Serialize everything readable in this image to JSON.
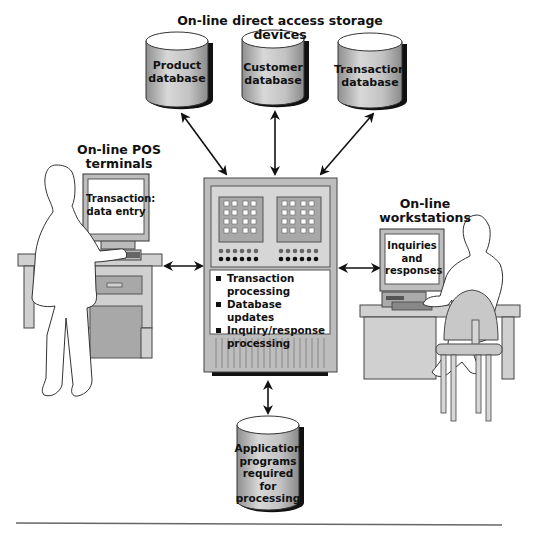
{
  "diagram": {
    "title": "On-line direct access storage devices",
    "databases": [
      {
        "label_line1": "Product",
        "label_line2": "database"
      },
      {
        "label_line1": "Customer",
        "label_line2": "database"
      },
      {
        "label_line1": "Transaction",
        "label_line2": "database"
      }
    ],
    "pos_terminals": {
      "title_line1": "On-line POS",
      "title_line2": "terminals",
      "screen_line1": "Transaction:",
      "screen_line2": "data entry"
    },
    "workstations": {
      "title_line1": "On-line",
      "title_line2": "workstations",
      "screen_line1": "Inquiries",
      "screen_line2": "and",
      "screen_line3": "responses"
    },
    "mainframe": {
      "functions": [
        "Transaction processing",
        "Database updates",
        "Inquiry/response processing"
      ]
    },
    "application_store": {
      "line1": "Application",
      "line2": "programs",
      "line3": "required",
      "line4": "for",
      "line5": "processing"
    },
    "colors": {
      "gray_fill": "#bdbdbd",
      "light_gray": "#d6d6d6",
      "dark_shadow": "#111111",
      "outline": "#333333"
    }
  }
}
